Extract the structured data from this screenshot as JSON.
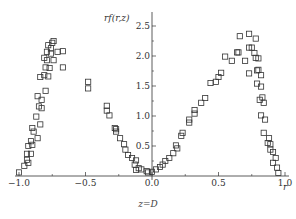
{
  "chart_data": {
    "type": "scatter",
    "title": "",
    "subtitle": "z=D",
    "xlabel": "r",
    "ylabel": "rf(r,z)",
    "xlim": [
      -1.0,
      1.0
    ],
    "ylim": [
      0,
      2.7
    ],
    "x_ticks": [
      -1.0,
      -0.5,
      0.0,
      0.5,
      1.0
    ],
    "x_tick_labels": [
      "−1.0",
      "−0.5",
      "0.0",
      "0.5",
      "1.0"
    ],
    "y_ticks": [
      0.5,
      1.0,
      1.5,
      2.0,
      2.5
    ],
    "y_tick_labels": [
      "0.5",
      "1.0",
      "1.5",
      "2.0",
      "2.5"
    ],
    "grid": false,
    "legend": null,
    "marker": "open-square",
    "marker_color": "#333333",
    "series": [
      {
        "name": "rf(r,z) at z=D",
        "points": [
          [
            -1.0,
            0.06
          ],
          [
            -0.96,
            0.17
          ],
          [
            -0.94,
            0.27
          ],
          [
            -0.93,
            0.22
          ],
          [
            -0.94,
            0.37
          ],
          [
            -0.91,
            0.37
          ],
          [
            -0.93,
            0.5
          ],
          [
            -0.9,
            0.52
          ],
          [
            -0.91,
            0.58
          ],
          [
            -0.89,
            0.74
          ],
          [
            -0.9,
            0.8
          ],
          [
            -0.86,
            0.63
          ],
          [
            -0.87,
            0.99
          ],
          [
            -0.84,
            0.86
          ],
          [
            -0.86,
            1.33
          ],
          [
            -0.83,
            1.27
          ],
          [
            -0.85,
            1.16
          ],
          [
            -0.83,
            1.13
          ],
          [
            -0.8,
            1.42
          ],
          [
            -0.84,
            1.65
          ],
          [
            -0.81,
            1.68
          ],
          [
            -0.78,
            1.66
          ],
          [
            -0.8,
            1.81
          ],
          [
            -0.77,
            1.8
          ],
          [
            -0.81,
            1.97
          ],
          [
            -0.79,
            1.93
          ],
          [
            -0.79,
            2.07
          ],
          [
            -0.76,
            2.04
          ],
          [
            -0.78,
            2.18
          ],
          [
            -0.76,
            2.13
          ],
          [
            -0.74,
            1.93
          ],
          [
            -0.75,
            2.22
          ],
          [
            -0.74,
            2.25
          ],
          [
            -0.71,
            2.07
          ],
          [
            -0.67,
            2.08
          ],
          [
            -0.67,
            1.81
          ],
          [
            -0.48,
            1.57
          ],
          [
            -0.48,
            1.46
          ],
          [
            -0.34,
            1.17
          ],
          [
            -0.34,
            1.09
          ],
          [
            -0.32,
            1.01
          ],
          [
            -0.28,
            0.8
          ],
          [
            -0.27,
            0.78
          ],
          [
            -0.27,
            0.74
          ],
          [
            -0.24,
            0.63
          ],
          [
            -0.21,
            0.53
          ],
          [
            -0.2,
            0.44
          ],
          [
            -0.18,
            0.35
          ],
          [
            -0.15,
            0.3
          ],
          [
            -0.12,
            0.26
          ],
          [
            -0.13,
            0.19
          ],
          [
            -0.1,
            0.13
          ],
          [
            -0.12,
            0.1
          ],
          [
            -0.08,
            0.11
          ],
          [
            -0.04,
            0.08
          ],
          [
            -0.03,
            0.06
          ],
          [
            0.0,
            0.07
          ],
          [
            0.03,
            0.11
          ],
          [
            0.06,
            0.15
          ],
          [
            0.08,
            0.19
          ],
          [
            0.1,
            0.25
          ],
          [
            0.13,
            0.3
          ],
          [
            0.16,
            0.38
          ],
          [
            0.18,
            0.51
          ],
          [
            0.19,
            0.46
          ],
          [
            0.22,
            0.67
          ],
          [
            0.23,
            0.72
          ],
          [
            0.28,
            0.89
          ],
          [
            0.28,
            0.94
          ],
          [
            0.32,
            1.04
          ],
          [
            0.32,
            1.1
          ],
          [
            0.37,
            1.22
          ],
          [
            0.4,
            1.3
          ],
          [
            0.44,
            1.55
          ],
          [
            0.48,
            1.57
          ],
          [
            0.5,
            1.65
          ],
          [
            0.52,
            1.72
          ],
          [
            0.55,
            1.99
          ],
          [
            0.6,
            1.92
          ],
          [
            0.64,
            2.06
          ],
          [
            0.65,
            2.06
          ],
          [
            0.66,
            2.33
          ],
          [
            0.7,
            1.92
          ],
          [
            0.73,
            1.71
          ],
          [
            0.73,
            2.37
          ],
          [
            0.73,
            2.14
          ],
          [
            0.75,
            2.14
          ],
          [
            0.78,
            2.29
          ],
          [
            0.77,
            2.05
          ],
          [
            0.78,
            1.97
          ],
          [
            0.8,
            1.96
          ],
          [
            0.79,
            1.76
          ],
          [
            0.8,
            1.77
          ],
          [
            0.82,
            1.68
          ],
          [
            0.79,
            1.54
          ],
          [
            0.82,
            1.49
          ],
          [
            0.81,
            1.27
          ],
          [
            0.83,
            1.31
          ],
          [
            0.84,
            1.22
          ],
          [
            0.82,
            1.01
          ],
          [
            0.85,
            0.94
          ],
          [
            0.84,
            0.72
          ],
          [
            0.88,
            0.63
          ],
          [
            0.87,
            0.55
          ],
          [
            0.89,
            0.53
          ],
          [
            0.89,
            0.44
          ],
          [
            0.91,
            0.4
          ],
          [
            0.91,
            0.22
          ],
          [
            0.93,
            0.3
          ],
          [
            0.94,
            0.14
          ],
          [
            0.95,
            0.05
          ]
        ]
      }
    ]
  }
}
